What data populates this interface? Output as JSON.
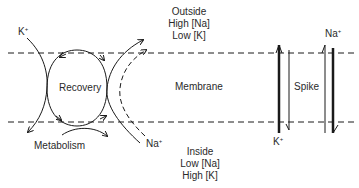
{
  "regions": {
    "outside": {
      "title": "Outside",
      "line1": "High [Na]",
      "line2": "Low [K]"
    },
    "inside": {
      "title": "Inside",
      "line1": "Low [Na]",
      "line2": "High [K]"
    },
    "membrane": "Membrane"
  },
  "labels": {
    "recovery": "Recovery",
    "metabolism": "Metabolism",
    "spike": "Spike",
    "k_ion_left": "K",
    "na_ion_left": "Na",
    "k_ion_spike": "K",
    "na_ion_spike": "Na",
    "charge": "+"
  },
  "colors": {
    "line": "#1a1a1a",
    "background": "#ffffff"
  }
}
